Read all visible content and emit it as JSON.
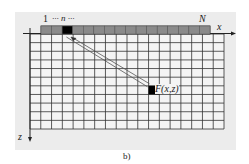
{
  "figure": {
    "caption": "b)",
    "colors": {
      "panel_bg": "#ececec",
      "grid_line": "#333333",
      "grid_cell": "#f4f4f4",
      "detector_cell": "#8a8a8a",
      "highlight_cell": "#000000"
    },
    "detector_array": {
      "cell_count": 16,
      "highlight_index": 2,
      "label_first": "1",
      "label_n": "··· n ···",
      "label_last": "N"
    },
    "grid": {
      "columns": 18,
      "rows": 11
    },
    "axes": {
      "x_label": "x",
      "z_label": "z"
    },
    "point": {
      "label": "F(x,z)",
      "column": 11,
      "row": 6
    }
  }
}
